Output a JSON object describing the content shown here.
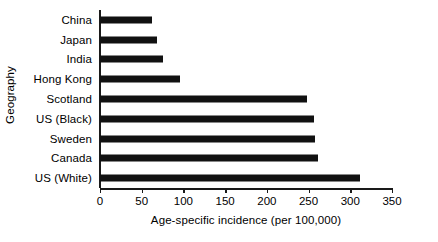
{
  "chart_data": {
    "type": "bar",
    "orientation": "horizontal",
    "title": "",
    "xlabel": "Age-specific incidence (per 100,000)",
    "ylabel": "Geography",
    "categories": [
      "China",
      "Japan",
      "India",
      "Hong Kong",
      "Scotland",
      "US (Black)",
      "Sweden",
      "Canada",
      "US (White)"
    ],
    "values": [
      62,
      68,
      75,
      96,
      248,
      256,
      258,
      261,
      312
    ],
    "xlim": [
      0,
      350
    ],
    "xticks": [
      0,
      50,
      100,
      150,
      200,
      250,
      300,
      350
    ],
    "xtick_labels": [
      "0",
      "50",
      "100",
      "150",
      "200",
      "250",
      "300",
      "350"
    ],
    "grid": false,
    "legend": null,
    "bar_color": "#111111",
    "axis_color": "#1a1a1a",
    "background": "#ffffff"
  }
}
